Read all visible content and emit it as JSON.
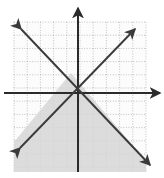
{
  "figure": {
    "alt": "graph-inequality-system",
    "width": 164,
    "height": 178
  },
  "colors": {
    "background": "#ffffff",
    "grid_line": "#9a9a9a",
    "grid_field": "#fcfcfc",
    "axis": "#2b2b2b",
    "line": "#3a3a3a",
    "shade_fill": "#d6d6d6",
    "shade_stroke": "#d6d6d6"
  },
  "grid": {
    "label": "dotted-square-grid",
    "left_px": 14,
    "top_px": 22,
    "right_px": 146,
    "bottom_px": 172,
    "cell_px": 13.2,
    "columns": 10,
    "rows": 11,
    "style": "dotted"
  },
  "axes": {
    "x_axis": {
      "label": "x-axis",
      "y_px": 93,
      "x_start_px": 4,
      "x_end_px": 160,
      "arrow_end": "right",
      "ticks": [],
      "tick_labels": []
    },
    "y_axis": {
      "label": "y-axis",
      "x_px": 78,
      "y_start_px": 172,
      "y_end_px": 8,
      "arrow_end": "up",
      "ticks": [],
      "tick_labels": []
    },
    "origin_px": {
      "x": 78,
      "y": 93
    }
  },
  "chart_data": {
    "type": "line",
    "title": "",
    "subtitle": "",
    "xlabel": "x",
    "ylabel": "y",
    "xlim": [
      -4.85,
      5.15
    ],
    "ylim": [
      -6.0,
      5.4
    ],
    "grid": true,
    "grid_spacing": 1,
    "legend": "none",
    "series": [
      {
        "name": "line-positive-slope",
        "equation": "y = x + 2",
        "slope": 1,
        "intercept": 2,
        "style": "solid",
        "arrows": "both",
        "endpoints_px": [
          {
            "x": 20,
            "y": 148
          },
          {
            "x": 135,
            "y": 29
          }
        ]
      },
      {
        "name": "line-negative-slope",
        "equation": "y = -x + 1",
        "slope": -1,
        "intercept": 1,
        "style": "solid",
        "arrows": "both",
        "endpoints_px": [
          {
            "x": 21,
            "y": 29
          },
          {
            "x": 150,
            "y": 165
          }
        ]
      }
    ],
    "intersection": {
      "x": -0.5,
      "y": 1.5,
      "px": {
        "x": 71,
        "y": 73
      }
    },
    "shaded_region": {
      "name": "solution-region",
      "description": "region below both lines",
      "fill": "#d6d6d6",
      "opacity": 0.85,
      "vertices_px": [
        {
          "x": 71,
          "y": 73
        },
        {
          "x": 146,
          "y": 161
        },
        {
          "x": 146,
          "y": 172
        },
        {
          "x": 14,
          "y": 172
        },
        {
          "x": 14,
          "y": 142
        }
      ]
    },
    "annotations": []
  }
}
